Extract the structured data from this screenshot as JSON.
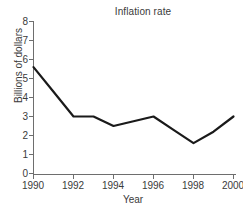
{
  "chart_data": {
    "type": "line",
    "title": "Inflation rate",
    "xlabel": "Year",
    "ylabel": "Billions of dollars",
    "x": [
      1990,
      1991,
      1992,
      1993,
      1994,
      1995,
      1996,
      1997,
      1998,
      1999,
      2000
    ],
    "values": [
      5.6,
      4.3,
      3.0,
      3.0,
      2.5,
      2.75,
      3.0,
      2.3,
      1.6,
      2.2,
      3.0
    ],
    "series": [
      {
        "name": "Inflation rate",
        "values": [
          5.6,
          4.3,
          3.0,
          3.0,
          2.5,
          2.75,
          3.0,
          2.3,
          1.6,
          2.2,
          3.0
        ]
      }
    ],
    "xlim": [
      1990,
      2000
    ],
    "ylim": [
      0,
      8
    ],
    "xticks": [
      1990,
      1992,
      1994,
      1996,
      1998,
      2000
    ],
    "xtick_labels": [
      "1990",
      "1992",
      "1994",
      "1996",
      "1998",
      "2000"
    ],
    "yticks": [
      0,
      1,
      2,
      3,
      4,
      5,
      6,
      7,
      8
    ],
    "ytick_labels": [
      "0",
      "1",
      "2",
      "3",
      "4",
      "5",
      "6",
      "7",
      "8"
    ],
    "grid": false,
    "legend": false,
    "line_color": "#1a1a1a",
    "axis_color": "#6e6e6e",
    "background_color": "#ffffff"
  }
}
